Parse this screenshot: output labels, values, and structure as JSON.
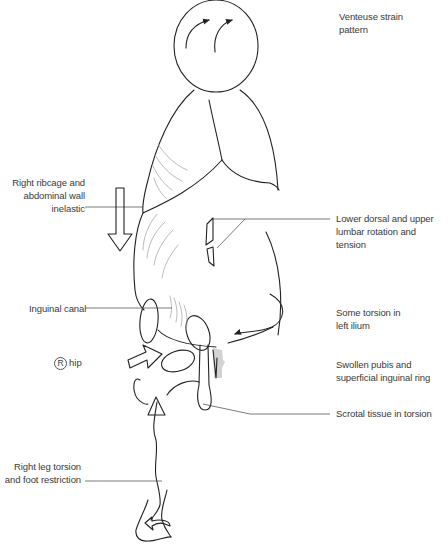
{
  "diagram": {
    "title": "Venteuse strain pattern",
    "labels": {
      "title_label": "Venteuse strain\npattern",
      "ribcage": "Right ribcage and\nabdominal wall\ninelastic",
      "lumbar": "Lower dorsal and upper\nlumbar rotation and tension",
      "inguinal_canal": "Inguinal canal",
      "ilium": "Some torsion in\nleft ilium",
      "hip_marker": "R",
      "hip": "hip",
      "pubis": "Swollen pubis and\nsuperficial inguinal ring",
      "scrotal": "Scrotal tissue in torsion",
      "leg": "Right leg torsion\nand foot restriction"
    },
    "colors": {
      "ink": "#222222",
      "leader": "#444444",
      "hatch": "#aaaaaa",
      "shading": "#b0b0b0",
      "text": "#3a3a3a",
      "background": "#ffffff"
    }
  }
}
